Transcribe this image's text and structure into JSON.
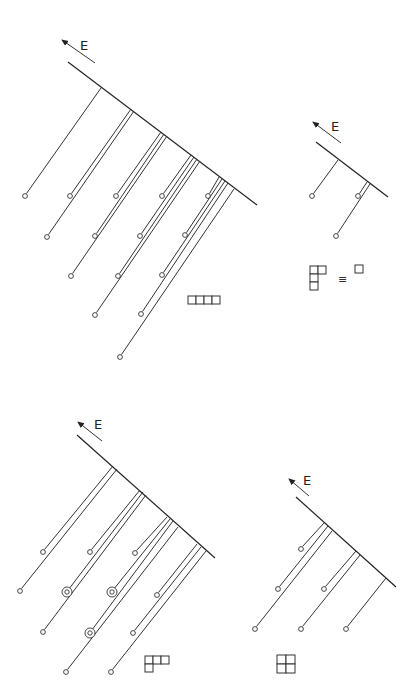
{
  "figure": {
    "width": 420,
    "height": 698,
    "stroke_color": "#333333",
    "axis_label": "E",
    "panels": [
      {
        "id": "top-left",
        "arrow": {
          "from": [
            95,
            63
          ],
          "to": [
            62,
            40
          ],
          "label_pos": [
            80,
            50
          ]
        },
        "baseline": {
          "from": [
            68,
            62
          ],
          "to": [
            257,
            205
          ]
        },
        "groups": [
          {
            "tops": [
              [
                101,
                88
              ]
            ],
            "ends": [
              [
                25,
                196
              ]
            ]
          },
          {
            "tops": [
              [
                131,
                109
              ],
              [
                134,
                111
              ]
            ],
            "ends": [
              [
                70,
                196
              ],
              [
                47,
                237
              ]
            ]
          },
          {
            "tops": [
              [
                161,
                132
              ],
              [
                164,
                134
              ],
              [
                167,
                136
              ]
            ],
            "ends": [
              [
                116,
                196
              ],
              [
                95,
                236
              ],
              [
                71,
                276
              ]
            ]
          },
          {
            "tops": [
              [
                191,
                155
              ],
              [
                194,
                157
              ],
              [
                197,
                159
              ],
              [
                200,
                161
              ]
            ],
            "ends": [
              [
                162,
                196
              ],
              [
                140,
                236
              ],
              [
                118,
                276
              ],
              [
                95,
                315
              ]
            ]
          },
          {
            "tops": [
              [
                219,
                177
              ],
              [
                222,
                179
              ],
              [
                225,
                181
              ],
              [
                228,
                183
              ],
              [
                234,
                189
              ]
            ],
            "ends": [
              [
                208,
                196
              ],
              [
                185,
                235
              ],
              [
                162,
                275
              ],
              [
                141,
                314
              ],
              [
                120,
                357
              ]
            ]
          }
        ],
        "double_circles": [],
        "tableau": {
          "origin": [
            188,
            296
          ],
          "cell": 8,
          "rows": [
            4
          ],
          "label": "(4)"
        }
      },
      {
        "id": "top-right",
        "arrow": {
          "from": [
            341,
            143
          ],
          "to": [
            313,
            122
          ],
          "label_pos": [
            331,
            131
          ]
        },
        "baseline": {
          "from": [
            316,
            142
          ],
          "to": [
            388,
            197
          ]
        },
        "groups": [
          {
            "tops": [
              [
                338,
                160
              ]
            ],
            "ends": [
              [
                312,
                196
              ]
            ]
          },
          {
            "tops": [
              [
                367,
                182
              ],
              [
                370,
                184
              ]
            ],
            "ends": [
              [
                358,
                196
              ],
              [
                336,
                236
              ]
            ]
          }
        ],
        "double_circles": [],
        "tableau": {
          "origin": [
            310,
            266
          ],
          "cell": 8,
          "rows": [
            2,
            1,
            1
          ],
          "label": "(2,1,1)"
        },
        "equivalence": {
          "symbol": "≡",
          "pos": [
            338,
            283
          ],
          "rhs_box": {
            "origin": [
              355,
              265
            ],
            "cell": 8
          }
        }
      },
      {
        "id": "bottom-left",
        "arrow": {
          "from": [
            102,
            441
          ],
          "to": [
            78,
            422
          ],
          "label_pos": [
            94,
            429
          ]
        },
        "baseline": {
          "from": [
            77,
            435
          ],
          "to": [
            215,
            558
          ]
        },
        "groups": [
          {
            "tops": [
              [
                113,
                466
              ],
              [
                117,
                469
              ]
            ],
            "ends": [
              [
                43,
                552
              ],
              [
                20,
                591
              ]
            ]
          },
          {
            "tops": [
              [
                140,
                490
              ],
              [
                143,
                492
              ],
              [
                146,
                495
              ]
            ],
            "ends": [
              [
                90,
                552
              ],
              [
                67,
                592
              ],
              [
                43,
                632
              ]
            ]
          },
          {
            "tops": [
              [
                167,
                517
              ],
              [
                170,
                519
              ],
              [
                173,
                521
              ],
              [
                178,
                527
              ]
            ],
            "ends": [
              [
                135,
                553
              ],
              [
                112,
                592
              ],
              [
                90,
                633
              ],
              [
                66,
                672
              ]
            ]
          },
          {
            "tops": [
              [
                197,
                544
              ],
              [
                201,
                547
              ],
              [
                206,
                551
              ]
            ],
            "ends": [
              [
                157,
                595
              ],
              [
                133,
                633
              ],
              [
                111,
                672
              ]
            ]
          }
        ],
        "double_circles": [
          [
            67,
            592
          ],
          [
            112,
            592
          ],
          [
            90,
            633
          ]
        ],
        "tableau": {
          "origin": [
            145,
            656
          ],
          "cell": 8,
          "rows": [
            3,
            1
          ],
          "label": "(3,1)"
        }
      },
      {
        "id": "bottom-right",
        "arrow": {
          "from": [
            309,
            496
          ],
          "to": [
            289,
            479
          ],
          "label_pos": [
            303,
            485
          ]
        },
        "baseline": {
          "from": [
            296,
            497
          ],
          "to": [
            396,
            587
          ]
        },
        "groups": [
          {
            "tops": [
              [
                324,
                523
              ],
              [
                328,
                526
              ],
              [
                332,
                531
              ]
            ],
            "ends": [
              [
                301,
                549
              ],
              [
                278,
                589
              ],
              [
                255,
                629
              ]
            ]
          },
          {
            "tops": [
              [
                356,
                551
              ],
              [
                360,
                555
              ]
            ],
            "ends": [
              [
                324,
                589
              ],
              [
                301,
                629
              ]
            ]
          },
          {
            "tops": [
              [
                386,
                578
              ]
            ],
            "ends": [
              [
                346,
                629
              ]
            ]
          }
        ],
        "double_circles": [],
        "tableau": {
          "origin": [
            277,
            655
          ],
          "cell": 9,
          "rows": [
            2,
            2
          ],
          "label": "(2,2)"
        }
      }
    ]
  }
}
